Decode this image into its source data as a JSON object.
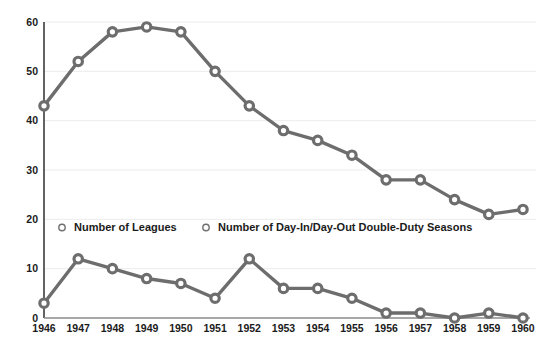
{
  "title_sliver": "·   ·          ·      ·   ·      ·         ·",
  "colors": {
    "series": "#6d6d6d",
    "gridline": "#ececed",
    "axis": "#3b3b3b",
    "text": "#1b1b1b",
    "background": "#ffffff"
  },
  "legend": {
    "position": "middle",
    "marker": "open-circle",
    "entries": [
      {
        "label": "Number of Leagues",
        "marker": "open-circle-icon"
      },
      {
        "label": "Number of Day-In/Day-Out Double-Duty Seasons",
        "marker": "open-circle-icon"
      }
    ]
  },
  "chart_data": {
    "type": "line",
    "title": "",
    "xlabel": "",
    "ylabel": "",
    "grid": true,
    "legend_position": "middle",
    "ylim": [
      0,
      60
    ],
    "yticks": [
      0,
      10,
      20,
      30,
      40,
      50,
      60
    ],
    "categories": [
      "1946",
      "1947",
      "1948",
      "1949",
      "1950",
      "1951",
      "1952",
      "1953",
      "1954",
      "1955",
      "1956",
      "1957",
      "1958",
      "1959",
      "1960"
    ],
    "series": [
      {
        "name": "Number of Leagues",
        "marker": "open-circle",
        "color": "#6d6d6d",
        "values": [
          43,
          52,
          58,
          59,
          58,
          50,
          43,
          38,
          36,
          33,
          28,
          28,
          24,
          21,
          22
        ]
      },
      {
        "name": "Number of Day-In/Day-Out Double-Duty Seasons",
        "marker": "open-circle",
        "color": "#6d6d6d",
        "values": [
          3,
          12,
          10,
          8,
          7,
          4,
          12,
          6,
          6,
          4,
          1,
          1,
          0,
          1,
          0
        ]
      }
    ]
  }
}
